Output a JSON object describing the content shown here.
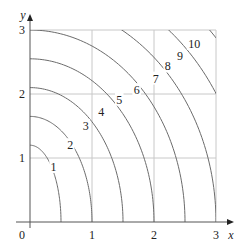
{
  "chart_data": {
    "type": "contour",
    "title": "",
    "xlabel": "x",
    "ylabel": "y",
    "xlim": [
      0,
      3
    ],
    "ylim": [
      0,
      3
    ],
    "grid": true,
    "x_ticks": [
      "0",
      "1",
      "2",
      "3"
    ],
    "y_ticks": [
      "1",
      "2",
      "3"
    ],
    "origin_label": "0",
    "levels": [
      1,
      2,
      3,
      4,
      5,
      6,
      7,
      8,
      9,
      10
    ],
    "level_labels": [
      "1",
      "2",
      "3",
      "4",
      "5",
      "6",
      "7",
      "8",
      "9",
      "10"
    ],
    "curves": [
      {
        "level": 1,
        "x_intercept": 0.5,
        "y_intercept": 1.2
      },
      {
        "level": 2,
        "x_intercept": 1.0,
        "y_intercept": 1.65
      },
      {
        "level": 3,
        "x_intercept": 1.5,
        "y_intercept": 2.1
      },
      {
        "level": 4,
        "x_intercept": 2.0,
        "y_intercept": 2.55
      },
      {
        "level": 5,
        "x_intercept": 2.5,
        "y_intercept": 3.0
      },
      {
        "level": 6,
        "x_intercept": 3.0,
        "y_intercept": 3.45
      },
      {
        "level": 7,
        "x_intercept": 3.5,
        "y_intercept": 3.9
      },
      {
        "level": 8,
        "x_intercept": 4.0,
        "y_intercept": 4.35
      },
      {
        "level": 9,
        "x_intercept": 4.5,
        "y_intercept": 4.8
      },
      {
        "level": 10,
        "x_intercept": 5.0,
        "y_intercept": 5.25
      }
    ],
    "label_positions": [
      {
        "level": 1,
        "x": 0.38,
        "y": 0.86
      },
      {
        "level": 2,
        "x": 0.65,
        "y": 1.2
      },
      {
        "level": 3,
        "x": 0.9,
        "y": 1.5
      },
      {
        "level": 4,
        "x": 1.15,
        "y": 1.72
      },
      {
        "level": 5,
        "x": 1.44,
        "y": 1.91
      },
      {
        "level": 6,
        "x": 1.72,
        "y": 2.06
      },
      {
        "level": 7,
        "x": 2.03,
        "y": 2.24
      },
      {
        "level": 8,
        "x": 2.22,
        "y": 2.43
      },
      {
        "level": 9,
        "x": 2.42,
        "y": 2.6
      },
      {
        "level": 10,
        "x": 2.65,
        "y": 2.78
      }
    ]
  },
  "colors": {
    "curve": "#6b6b6b",
    "grid": "#c8c8c8",
    "axis": "#555555",
    "text": "#222222"
  }
}
